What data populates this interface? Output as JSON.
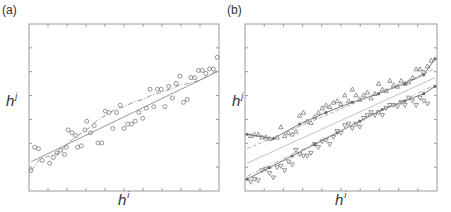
{
  "chart_data": [
    {
      "panel": "(a)",
      "type": "scatter",
      "xlabel": "h",
      "xlabel_sup": "i",
      "ylabel": "h",
      "ylabel_sup": "j",
      "xlim": [
        0,
        1
      ],
      "ylim": [
        0,
        1
      ],
      "grid": false,
      "ticks_x": 10,
      "ticks_y": 7,
      "series": [
        {
          "name": "points",
          "kind": "scatter",
          "marker": "circle",
          "color": "#8a8a8a",
          "x": [
            0.0,
            0.02,
            0.04,
            0.06,
            0.1,
            0.12,
            0.14,
            0.16,
            0.18,
            0.19,
            0.2,
            0.22,
            0.24,
            0.25,
            0.27,
            0.29,
            0.3,
            0.32,
            0.34,
            0.36,
            0.38,
            0.4,
            0.42,
            0.44,
            0.46,
            0.48,
            0.5,
            0.52,
            0.54,
            0.56,
            0.58,
            0.6,
            0.62,
            0.64,
            0.66,
            0.68,
            0.7,
            0.72,
            0.74,
            0.76,
            0.78,
            0.8,
            0.82,
            0.84,
            0.86,
            0.88,
            0.9,
            0.92,
            0.94,
            0.96,
            0.98,
            1.0
          ],
          "y": [
            0.1,
            0.26,
            0.25,
            0.17,
            0.15,
            0.19,
            0.22,
            0.24,
            0.21,
            0.26,
            0.38,
            0.36,
            0.34,
            0.26,
            0.27,
            0.38,
            0.44,
            0.36,
            0.41,
            0.29,
            0.29,
            0.51,
            0.5,
            0.39,
            0.5,
            0.55,
            0.39,
            0.42,
            0.42,
            0.44,
            0.5,
            0.46,
            0.53,
            0.66,
            0.54,
            0.66,
            0.66,
            0.54,
            0.68,
            0.6,
            0.7,
            0.75,
            0.57,
            0.59,
            0.74,
            0.74,
            0.79,
            0.79,
            0.77,
            0.8,
            0.8,
            0.88
          ]
        },
        {
          "name": "fit",
          "kind": "line",
          "style": "solid",
          "color": "#8a8a8a",
          "x": [
            0,
            1
          ],
          "y": [
            0.16,
            0.78
          ]
        },
        {
          "name": "average",
          "kind": "line",
          "style": "dashdot",
          "color": "#8a8a8a",
          "x": [
            0.0,
            0.05,
            0.1,
            0.15,
            0.2,
            0.25,
            0.3,
            0.35,
            0.4,
            0.45,
            0.5,
            0.55,
            0.6,
            0.65,
            0.7,
            0.75,
            0.8,
            0.85,
            0.9,
            0.95,
            1.0
          ],
          "y": [
            0.1,
            0.18,
            0.2,
            0.22,
            0.29,
            0.34,
            0.38,
            0.44,
            0.48,
            0.52,
            0.54,
            0.57,
            0.59,
            0.62,
            0.64,
            0.66,
            0.69,
            0.7,
            0.72,
            0.75,
            0.79
          ]
        }
      ]
    },
    {
      "panel": "(b)",
      "type": "scatter",
      "xlabel": "h",
      "xlabel_sup": "i",
      "ylabel": "h",
      "ylabel_sup": "j",
      "xlim": [
        0,
        1
      ],
      "ylim": [
        0,
        1
      ],
      "grid": false,
      "ticks_x": 10,
      "ticks_y": 7,
      "series": [
        {
          "name": "upper-points",
          "kind": "scatter",
          "marker": "triangle-up",
          "color": "#8a8a8a",
          "x": [
            0.02,
            0.04,
            0.06,
            0.08,
            0.1,
            0.12,
            0.16,
            0.18,
            0.2,
            0.22,
            0.24,
            0.26,
            0.28,
            0.3,
            0.32,
            0.34,
            0.36,
            0.38,
            0.4,
            0.42,
            0.44,
            0.46,
            0.48,
            0.5,
            0.52,
            0.54,
            0.56,
            0.58,
            0.6,
            0.62,
            0.64,
            0.66,
            0.68,
            0.7,
            0.72,
            0.74,
            0.76,
            0.78,
            0.8,
            0.82,
            0.84,
            0.86,
            0.88,
            0.9,
            0.92,
            0.94,
            0.96,
            0.98
          ],
          "y": [
            0.34,
            0.35,
            0.35,
            0.33,
            0.33,
            0.32,
            0.33,
            0.4,
            0.34,
            0.36,
            0.35,
            0.37,
            0.48,
            0.5,
            0.44,
            0.43,
            0.47,
            0.5,
            0.53,
            0.55,
            0.54,
            0.57,
            0.58,
            0.56,
            0.62,
            0.58,
            0.66,
            0.62,
            0.59,
            0.62,
            0.64,
            0.6,
            0.63,
            0.7,
            0.66,
            0.65,
            0.72,
            0.69,
            0.68,
            0.72,
            0.7,
            0.71,
            0.74,
            0.8,
            0.8,
            0.78,
            0.82,
            0.86
          ]
        },
        {
          "name": "lower-points",
          "kind": "scatter",
          "marker": "triangle-down",
          "color": "#8a8a8a",
          "x": [
            0.02,
            0.04,
            0.06,
            0.08,
            0.1,
            0.12,
            0.14,
            0.16,
            0.18,
            0.2,
            0.22,
            0.24,
            0.26,
            0.28,
            0.3,
            0.32,
            0.34,
            0.36,
            0.38,
            0.4,
            0.42,
            0.44,
            0.46,
            0.48,
            0.5,
            0.52,
            0.54,
            0.56,
            0.58,
            0.6,
            0.62,
            0.64,
            0.66,
            0.68,
            0.7,
            0.72,
            0.74,
            0.76,
            0.78,
            0.8,
            0.82,
            0.84,
            0.86,
            0.88,
            0.9,
            0.92,
            0.94,
            0.96
          ],
          "y": [
            0.02,
            0.04,
            0.03,
            0.1,
            0.11,
            0.08,
            0.05,
            0.12,
            0.13,
            0.1,
            0.16,
            0.14,
            0.24,
            0.21,
            0.2,
            0.2,
            0.22,
            0.28,
            0.26,
            0.3,
            0.31,
            0.28,
            0.33,
            0.37,
            0.36,
            0.41,
            0.42,
            0.39,
            0.42,
            0.4,
            0.46,
            0.48,
            0.5,
            0.48,
            0.5,
            0.48,
            0.53,
            0.55,
            0.55,
            0.54,
            0.57,
            0.55,
            0.6,
            0.58,
            0.55,
            0.6,
            0.58,
            0.56
          ]
        },
        {
          "name": "upper-path",
          "kind": "line",
          "style": "solid-markers",
          "color": "#6a6a6a",
          "x": [
            0.0,
            0.14,
            0.28,
            0.42,
            0.56,
            0.7,
            0.84,
            0.94,
            1.0
          ],
          "y": [
            0.35,
            0.32,
            0.42,
            0.5,
            0.57,
            0.63,
            0.7,
            0.76,
            0.87
          ]
        },
        {
          "name": "lower-path",
          "kind": "line",
          "style": "solid-markers",
          "color": "#6a6a6a",
          "x": [
            0.0,
            0.12,
            0.24,
            0.36,
            0.48,
            0.6,
            0.72,
            0.84,
            0.94,
            1.0
          ],
          "y": [
            0.04,
            0.12,
            0.2,
            0.28,
            0.36,
            0.44,
            0.52,
            0.58,
            0.63,
            0.68
          ]
        },
        {
          "name": "upper-fit",
          "kind": "line",
          "style": "dashed",
          "color": "#aaaaaa",
          "x": [
            0,
            1
          ],
          "y": [
            0.25,
            0.8
          ]
        },
        {
          "name": "lower-fit",
          "kind": "line",
          "style": "dashdot",
          "color": "#aaaaaa",
          "x": [
            0,
            1
          ],
          "y": [
            0.06,
            0.69
          ]
        },
        {
          "name": "mid-fit",
          "kind": "line",
          "style": "solid",
          "color": "#bbbbbb",
          "x": [
            0,
            1
          ],
          "y": [
            0.15,
            0.74
          ]
        }
      ]
    }
  ]
}
